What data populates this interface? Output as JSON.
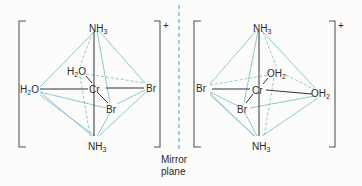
{
  "diagram": {
    "type": "stereochemistry-enantiomers",
    "charge": "+",
    "mirror": {
      "label_line1": "Mirror",
      "label_line2": "plane",
      "color": "#58aee0"
    },
    "edge_color": "#7fc3c9",
    "left_complex": {
      "center": "Cr",
      "top": {
        "main": "NH",
        "sub": "3"
      },
      "bottom": {
        "main": "NH",
        "sub": "3"
      },
      "left": {
        "pre": "H",
        "sub": "2",
        "post": "O"
      },
      "right": "Br",
      "back": {
        "pre": "H",
        "sub": "2",
        "post": "O"
      },
      "front": "Br"
    },
    "right_complex": {
      "center": "Cr",
      "top": {
        "main": "NH",
        "sub": "3"
      },
      "bottom": {
        "main": "NH",
        "sub": "3"
      },
      "left": "Br",
      "right": {
        "main": "OH",
        "sub": "2"
      },
      "back": {
        "main": "OH",
        "sub": "2"
      },
      "front": "Br"
    }
  }
}
